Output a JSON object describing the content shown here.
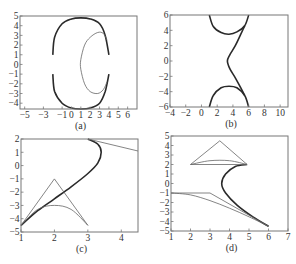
{
  "figure": {
    "panels": [
      "(a)",
      "(b)",
      "(c)",
      "(d)"
    ]
  },
  "chart_data": [
    {
      "type": "line",
      "panel": "(a)",
      "caption": "(a)",
      "xlabel": "",
      "ylabel": "",
      "xlim": [
        -5.5,
        7
      ],
      "ylim": [
        -4.6,
        5
      ],
      "xticks": [
        -5,
        -3,
        -1,
        0,
        1,
        2,
        3,
        4,
        5,
        6
      ],
      "yticks": [
        5,
        4,
        3,
        2,
        1,
        0,
        -1,
        -2,
        -3,
        -4
      ],
      "grid": false,
      "series": [
        {
          "name": "outer-boundary-upper (thick)",
          "x": [
            -2,
            -1.8,
            -1,
            0,
            1,
            2,
            3,
            3.6,
            4
          ],
          "y": [
            1,
            2.8,
            4.2,
            4.7,
            4.8,
            4.7,
            4.2,
            3,
            1
          ]
        },
        {
          "name": "outer-boundary-lower (thick)",
          "x": [
            -2,
            -1.8,
            -1,
            0,
            1,
            2,
            3,
            3.6,
            4
          ],
          "y": [
            -1,
            -2.8,
            -4,
            -4.5,
            -4.6,
            -4.5,
            -4,
            -2.8,
            -1
          ]
        },
        {
          "name": "inner-curve (thin)",
          "x": [
            3.8,
            3.4,
            2.8,
            2,
            1.4,
            1,
            1,
            1.4,
            2,
            2.8,
            3.4,
            3.8
          ],
          "y": [
            2.5,
            3.2,
            3.3,
            2.8,
            2,
            0.5,
            -0.5,
            -2,
            -2.8,
            -3,
            -2.6,
            -1.8
          ]
        }
      ]
    },
    {
      "type": "line",
      "panel": "(b)",
      "caption": "(b)",
      "xlabel": "",
      "ylabel": "",
      "xlim": [
        -4,
        11
      ],
      "ylim": [
        -6,
        6
      ],
      "xticks": [
        -4,
        -2,
        0,
        2,
        4,
        6,
        8,
        10
      ],
      "yticks": [
        6,
        4,
        2,
        0,
        -2,
        -4,
        -6
      ],
      "grid": false,
      "series": [
        {
          "name": "upper-arc (thick)",
          "x": [
            1,
            1.5,
            2.5,
            3.5,
            4.5,
            5.5,
            6
          ],
          "y": [
            6,
            4.5,
            3.7,
            3.5,
            3.8,
            4.6,
            6
          ]
        },
        {
          "name": "s-curve (thick)",
          "x": [
            5.5,
            5,
            4.3,
            3.6,
            3.3,
            3.6,
            4.3,
            5,
            5.5
          ],
          "y": [
            4.6,
            3.5,
            2,
            0.8,
            0,
            -1,
            -2.2,
            -3.5,
            -4.5
          ]
        },
        {
          "name": "lower-arc (thick)",
          "x": [
            1,
            1.5,
            2.5,
            3.5,
            4.5,
            5.5,
            6
          ],
          "y": [
            -6,
            -4.5,
            -3.5,
            -3.3,
            -3.5,
            -4.5,
            -6
          ]
        }
      ]
    },
    {
      "type": "line",
      "panel": "(c)",
      "caption": "(c)",
      "xlabel": "",
      "ylabel": "",
      "xlim": [
        1,
        4.5
      ],
      "ylim": [
        -5,
        2
      ],
      "xticks": [
        1,
        2,
        3,
        4
      ],
      "yticks": [
        2,
        1,
        0,
        -1,
        -2,
        -3,
        -4,
        -5
      ],
      "grid": false,
      "series": [
        {
          "name": "main-curve (thick)",
          "x": [
            1,
            1.5,
            2,
            2.5,
            3,
            3.3,
            3.4,
            3.3,
            3
          ],
          "y": [
            -4.5,
            -3.4,
            -2.5,
            -1.6,
            -0.6,
            0.2,
            1,
            1.6,
            2
          ]
        },
        {
          "name": "triangle (thin)",
          "x": [
            1,
            2,
            3
          ],
          "y": [
            -4.5,
            -1,
            -4.5
          ]
        },
        {
          "name": "lower-arc (thin)",
          "x": [
            1,
            1.5,
            2,
            2.5,
            3
          ],
          "y": [
            -4.5,
            -3.3,
            -3,
            -3.3,
            -4.5
          ]
        },
        {
          "name": "tangent-line (thin)",
          "x": [
            3,
            4.5
          ],
          "y": [
            2,
            1.1
          ]
        }
      ]
    },
    {
      "type": "line",
      "panel": "(d)",
      "caption": "(d)",
      "xlabel": "",
      "ylabel": "",
      "xlim": [
        1,
        7
      ],
      "ylim": [
        -5,
        5
      ],
      "xticks": [
        1,
        2,
        3,
        4,
        5,
        6,
        7
      ],
      "yticks": [
        5,
        4,
        3,
        2,
        1,
        0,
        -1,
        -2,
        -3,
        -4,
        -5
      ],
      "grid": false,
      "series": [
        {
          "name": "main-curve (thick)",
          "x": [
            4.9,
            4.3,
            3.8,
            3.6,
            3.8,
            4.4,
            5.2,
            6
          ],
          "y": [
            2,
            1.8,
            1,
            0,
            -1,
            -2.3,
            -3.5,
            -4.5
          ]
        },
        {
          "name": "upper-triangle (thin)",
          "x": [
            2,
            3.5,
            4.9,
            2
          ],
          "y": [
            2,
            4.5,
            2,
            2
          ]
        },
        {
          "name": "upper-arc (thin)",
          "x": [
            2,
            3,
            4,
            4.9
          ],
          "y": [
            2,
            2.4,
            2.4,
            2
          ]
        },
        {
          "name": "lower-polyline (thin)",
          "x": [
            1,
            3,
            6
          ],
          "y": [
            -1,
            -1,
            -4.5
          ]
        },
        {
          "name": "lower-curve (thin)",
          "x": [
            1,
            2,
            3,
            4,
            5,
            6
          ],
          "y": [
            -1,
            -1.2,
            -1.8,
            -2.6,
            -3.5,
            -4.5
          ]
        }
      ]
    }
  ]
}
